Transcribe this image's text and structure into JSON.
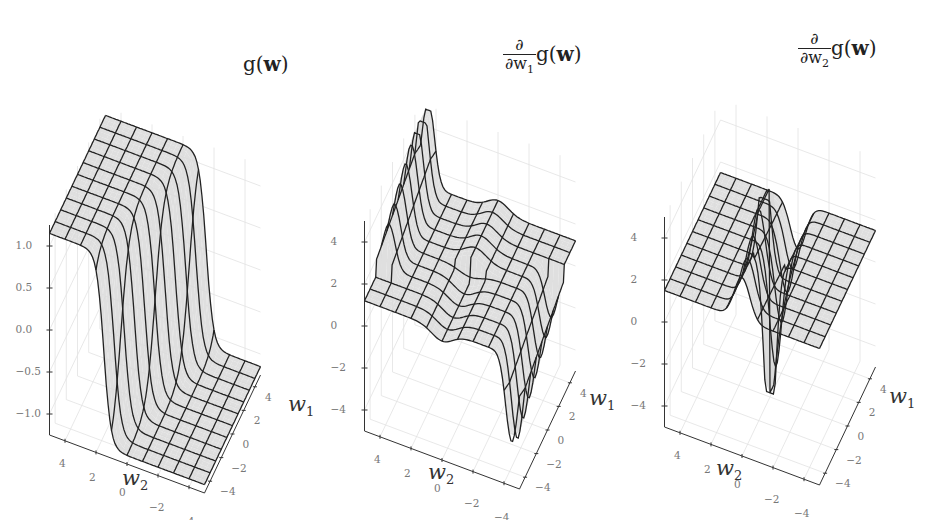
{
  "chart_data": [
    {
      "type": "surface3d",
      "title": "g(w)",
      "title_parts": {
        "fn": "g(",
        "var": "w",
        "close": ")"
      },
      "xlabel": "w1",
      "ylabel": "w2",
      "zlabel": "",
      "x_ticks": [
        "4",
        "2",
        "0",
        "−2",
        "−4"
      ],
      "y_ticks": [
        "4",
        "2",
        "0",
        "−2",
        "−4"
      ],
      "z_ticks": [
        "1.0",
        "0.5",
        "0.0",
        "−0.5",
        "−1.0"
      ],
      "xlim": [
        -5,
        5
      ],
      "ylim": [
        -5,
        5
      ],
      "zlim": [
        -1,
        1
      ],
      "description": "Step-like surface: plateaus at +1 and −1 separated by steep sigmoid walls along a diagonal",
      "surface_kind": "step"
    },
    {
      "type": "surface3d",
      "title": "∂/∂w1 g(w)",
      "title_parts": {
        "num": "∂",
        "den": "∂w",
        "den_sub": "1",
        "fn": "g(",
        "var": "w",
        "close": ")"
      },
      "xlabel": "w1",
      "ylabel": "w2",
      "x_ticks": [
        "4",
        "2",
        "0",
        "−2",
        "−4"
      ],
      "y_ticks": [
        "4",
        "2",
        "0",
        "−2",
        "−4"
      ],
      "z_ticks": [
        "4",
        "2",
        "0",
        "−2",
        "−4"
      ],
      "xlim": [
        -5,
        5
      ],
      "ylim": [
        -5,
        5
      ],
      "zlim": [
        -5,
        5
      ],
      "description": "Mostly flat near 0 with a sharp positive spike at one corner and a sharp negative spike at the opposite corner",
      "surface_kind": "dw1"
    },
    {
      "type": "surface3d",
      "title": "∂/∂w2 g(w)",
      "title_parts": {
        "num": "∂",
        "den": "∂w",
        "den_sub": "2",
        "fn": "g(",
        "var": "w",
        "close": ")"
      },
      "xlabel": "w1",
      "ylabel": "w2",
      "x_ticks": [
        "4",
        "2",
        "0",
        "−2",
        "−4"
      ],
      "y_ticks": [
        "4",
        "2",
        "0",
        "−2",
        "−4"
      ],
      "z_ticks": [
        "4",
        "2",
        "0",
        "−2",
        "−4"
      ],
      "xlim": [
        -5,
        5
      ],
      "ylim": [
        -5,
        5
      ],
      "zlim": [
        -5,
        5
      ],
      "description": "Flat plane near 0 with a thin positive spike and a thin negative spike along the center line",
      "surface_kind": "dw2"
    }
  ],
  "colors": {
    "surface_fill": "#d9d9d9",
    "surface_fill_dark": "#9a9a9a",
    "mesh_line": "#222222",
    "axis_line": "#333333",
    "grid_line": "#e2e2e2",
    "tick_text": "#777777"
  },
  "axis_labels": {
    "w1": "w",
    "w1_sub": "1",
    "w2": "w",
    "w2_sub": "2"
  }
}
